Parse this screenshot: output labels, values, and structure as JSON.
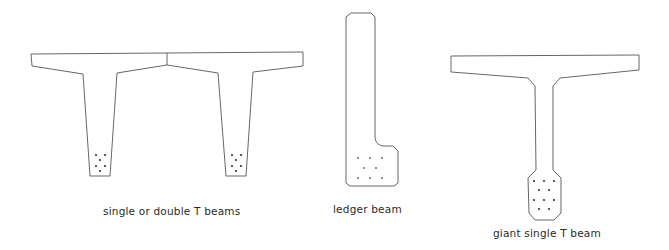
{
  "diagram": {
    "type": "beam cross-section sketches",
    "stroke_color": "#555555",
    "background": "#ffffff",
    "figures": [
      {
        "id": "double-t",
        "label": "single or double T beams",
        "description": "Two adjoining tapered-web T beams sharing a continuous top flange, each web with 6 prestressing strand dots near the bottom",
        "strand_count_per_web": 6
      },
      {
        "id": "ledger",
        "label": "ledger beam",
        "description": "Tall rectangular beam with chamfered top corners and a ledge projecting at the lower right, with 8 strand dots in the base",
        "strand_count": 8
      },
      {
        "id": "giant-t",
        "label": "giant single T beam",
        "description": "Wide single T beam with slender web ending in a chamfered bulb containing 11 strand dots",
        "strand_count": 11
      }
    ]
  }
}
